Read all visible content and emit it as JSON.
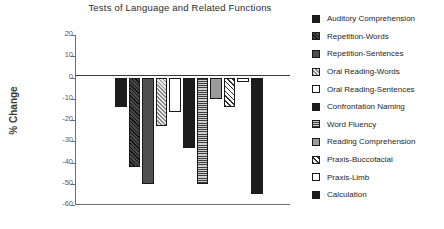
{
  "chart_data": {
    "type": "bar",
    "title": "Tests of Language and Related Functions",
    "xlabel": "",
    "ylabel": "% Change",
    "ylim": [
      -60,
      20
    ],
    "yticks": [
      20,
      10,
      0,
      -10,
      -20,
      -30,
      -40,
      -50,
      -60
    ],
    "ytick_labels": [
      "20",
      "10",
      "0",
      "-10",
      "-20",
      "-30",
      "-40",
      "-50",
      "-60"
    ],
    "grid": false,
    "legend_position": "right",
    "categories": [
      "Auditory Comprehension",
      "Repetition-Words",
      "Repetition-Sentences",
      "Oral Reading-Words",
      "Oral Reading-Sentences",
      "Confrontation Naming",
      "Word Fluency",
      "Reading Comprehension",
      "Praxis-Buccofacial",
      "Praxis-Limb",
      "Calculation"
    ],
    "values": [
      -14,
      -42,
      -50,
      -23,
      -16,
      -33,
      -50,
      -10,
      -14,
      -2,
      -55
    ],
    "bar_fills": [
      "solid-black",
      "diagonal-hatch-dark",
      "solid-gray",
      "diagonal-hatch-light",
      "white",
      "solid-black",
      "horizontal-lines",
      "mid-gray",
      "diagonal-hatch-white",
      "white",
      "solid-black"
    ]
  },
  "legend": {
    "items": [
      {
        "label": "Auditory Comprehension",
        "fill": "solid-black"
      },
      {
        "label": "Repetition-Words",
        "fill": "diagonal-hatch-dark"
      },
      {
        "label": "Repetition-Sentences",
        "fill": "solid-gray"
      },
      {
        "label": "Oral Reading-Words",
        "fill": "diagonal-hatch-light"
      },
      {
        "label": "Oral Reading-Sentences",
        "fill": "white"
      },
      {
        "label": "Confrontation Naming",
        "fill": "solid-black"
      },
      {
        "label": "Word Fluency",
        "fill": "horizontal-lines"
      },
      {
        "label": "Reading Comprehension",
        "fill": "mid-gray"
      },
      {
        "label": "Praxis-Buccofacial",
        "fill": "diagonal-hatch-white"
      },
      {
        "label": "Praxis-Limb",
        "fill": "white"
      },
      {
        "label": "Calculation",
        "fill": "solid-black"
      }
    ]
  }
}
